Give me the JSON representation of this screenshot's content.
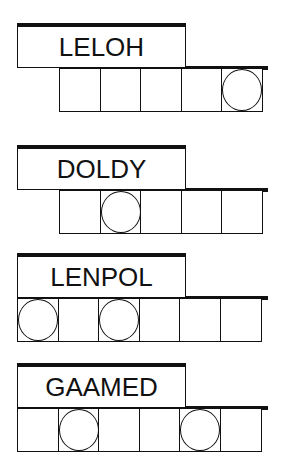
{
  "puzzles": [
    {
      "word": "LELOH",
      "cells": 5,
      "circled": [
        5
      ]
    },
    {
      "word": "DOLDY",
      "cells": 5,
      "circled": [
        2
      ]
    },
    {
      "word": "LENPOL",
      "cells": 6,
      "circled": [
        1,
        3
      ]
    },
    {
      "word": "GAAMED",
      "cells": 6,
      "circled": [
        2,
        5
      ]
    }
  ]
}
